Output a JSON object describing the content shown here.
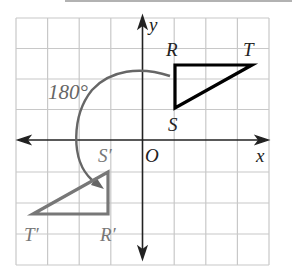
{
  "figure": {
    "angle_label": "180°",
    "axis_x_label": "x",
    "axis_y_label": "y",
    "origin_label": "O",
    "grid": {
      "cols": 8,
      "rows": 8,
      "x_range": [
        -4,
        4
      ],
      "y_range": [
        -4,
        4
      ]
    },
    "preimage": {
      "name": "triangle RST",
      "color": "#000000",
      "vertices": {
        "R": [
          1,
          2.5
        ],
        "S": [
          1,
          1
        ],
        "T": [
          3.5,
          2.5
        ]
      },
      "labels": {
        "R": "R",
        "S": "S",
        "T": "T"
      }
    },
    "image": {
      "name": "triangle R'S'T'",
      "color": "#777777",
      "vertices": {
        "R'": [
          -1,
          -2.5
        ],
        "S'": [
          -1,
          -1
        ],
        "T'": [
          -3.5,
          -2.5
        ]
      },
      "labels": {
        "R": "R′",
        "S": "S′",
        "T": "T′"
      }
    },
    "rotation": {
      "angle": 180,
      "center": "O",
      "arc_color": "#666666"
    }
  }
}
